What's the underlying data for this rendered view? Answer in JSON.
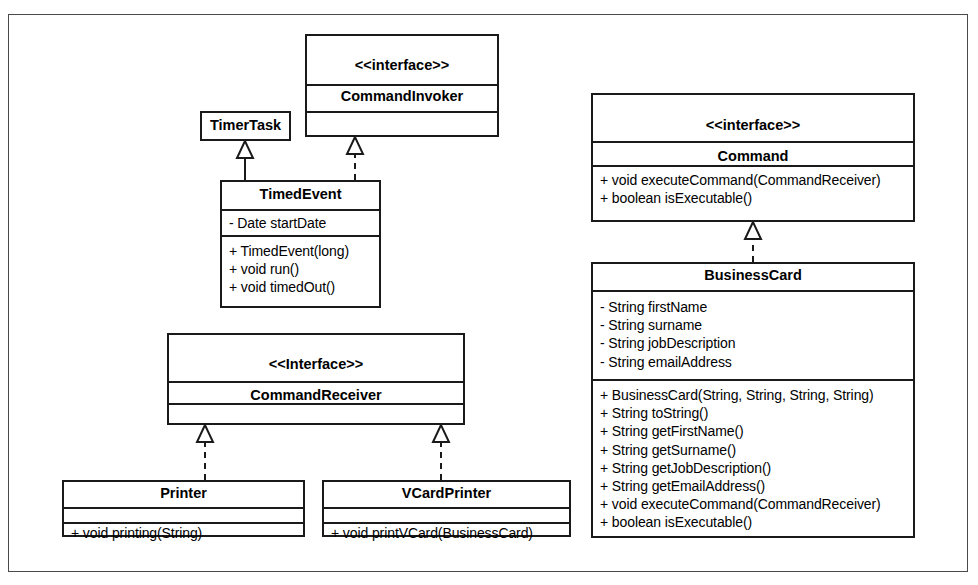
{
  "diagram": {
    "type": "uml-class-diagram",
    "colors": {
      "box_border": "#1a1a1a",
      "frame_border": "#4a4a4a",
      "background": "#ffffff",
      "text": "#000000"
    },
    "classes": {
      "timertask": {
        "stereotype": "",
        "name": "TimerTask",
        "attributes": [],
        "operations": []
      },
      "commandinvoker": {
        "stereotype": "<<interface>>",
        "name": "CommandInvoker",
        "attributes": [],
        "operations": []
      },
      "timedevent": {
        "stereotype": "",
        "name": "TimedEvent",
        "attributes": [
          "- Date startDate"
        ],
        "operations": [
          "+ TimedEvent(long)",
          "+ void run()",
          "+ void timedOut()"
        ]
      },
      "commandreceiver": {
        "stereotype": "<<Interface>>",
        "name": "CommandReceiver",
        "attributes": [],
        "operations": []
      },
      "printer": {
        "stereotype": "",
        "name": "Printer",
        "attributes": [],
        "operations": [
          "+ void printing(String)"
        ]
      },
      "vcardprinter": {
        "stereotype": "",
        "name": "VCardPrinter",
        "attributes": [],
        "operations": [
          "+ void printVCard(BusinessCard)"
        ]
      },
      "command": {
        "stereotype": "<<interface>>",
        "name": "Command",
        "attributes": [],
        "operations": [
          "+ void executeCommand(CommandReceiver)",
          "+ boolean isExecutable()"
        ]
      },
      "businesscard": {
        "stereotype": "",
        "name": "BusinessCard",
        "attributes": [
          "- String firstName",
          "- String surname",
          "- String jobDescription",
          "- String emailAddress"
        ],
        "operations": [
          "+ BusinessCard(String, String, String, String)",
          "+ String toString()",
          "+ String getFirstName()",
          "+ String getSurname()",
          "+ String getJobDescription()",
          "+ String getEmailAddress()",
          "+ void executeCommand(CommandReceiver)",
          "+ boolean isExecutable()"
        ]
      }
    },
    "relationships": [
      {
        "from": "timedevent",
        "to": "timertask",
        "kind": "generalization",
        "line": "solid"
      },
      {
        "from": "timedevent",
        "to": "commandinvoker",
        "kind": "realization",
        "line": "dashed"
      },
      {
        "from": "printer",
        "to": "commandreceiver",
        "kind": "realization",
        "line": "dashed"
      },
      {
        "from": "vcardprinter",
        "to": "commandreceiver",
        "kind": "realization",
        "line": "dashed"
      },
      {
        "from": "businesscard",
        "to": "command",
        "kind": "realization",
        "line": "dashed"
      }
    ]
  }
}
